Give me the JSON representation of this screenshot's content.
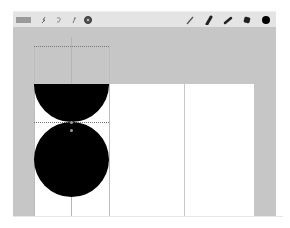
{
  "toolbar": {
    "gallery_label": "图库",
    "left_tools": [
      {
        "name": "adjustments-icon",
        "glyph": "⚡"
      },
      {
        "name": "selection-icon",
        "glyph": "∫"
      },
      {
        "name": "transform-icon",
        "glyph": "↗"
      }
    ],
    "active_tool": "settings-circle-icon",
    "right_tools": [
      {
        "name": "brush-icon"
      },
      {
        "name": "smudge-icon"
      },
      {
        "name": "eraser-icon"
      },
      {
        "name": "layers-icon"
      },
      {
        "name": "color-swatch-icon"
      }
    ]
  },
  "colors": {
    "toolbar_bg": "#e4e4e4",
    "canvas_bg": "#c6c6c6",
    "page_bg": "#ffffff",
    "shape_fill": "#000000",
    "guide": "#777777",
    "current_color": "#000000"
  },
  "canvas": {
    "shapes": [
      {
        "type": "half-disc",
        "fill": "#000000"
      },
      {
        "type": "disc",
        "fill": "#000000"
      }
    ]
  }
}
